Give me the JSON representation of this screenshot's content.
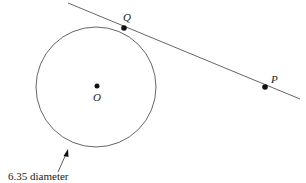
{
  "diagram": {
    "type": "geometry",
    "circle": {
      "cx": 96,
      "cy": 87,
      "r": 60,
      "center_label": "O"
    },
    "tangent_line": {
      "x1": 68,
      "y1": 3,
      "x2": 300,
      "y2": 99
    },
    "points": [
      {
        "id": "Q",
        "label": "Q",
        "x": 124,
        "y": 28
      },
      {
        "id": "P",
        "label": "P",
        "x": 265,
        "y": 87
      },
      {
        "id": "O",
        "label": "O",
        "x": 97,
        "y": 86
      }
    ],
    "annotation": {
      "text": "6.35 diameter"
    },
    "colors": {
      "stroke": "#555555",
      "point": "#111111",
      "text": "#222222"
    }
  }
}
